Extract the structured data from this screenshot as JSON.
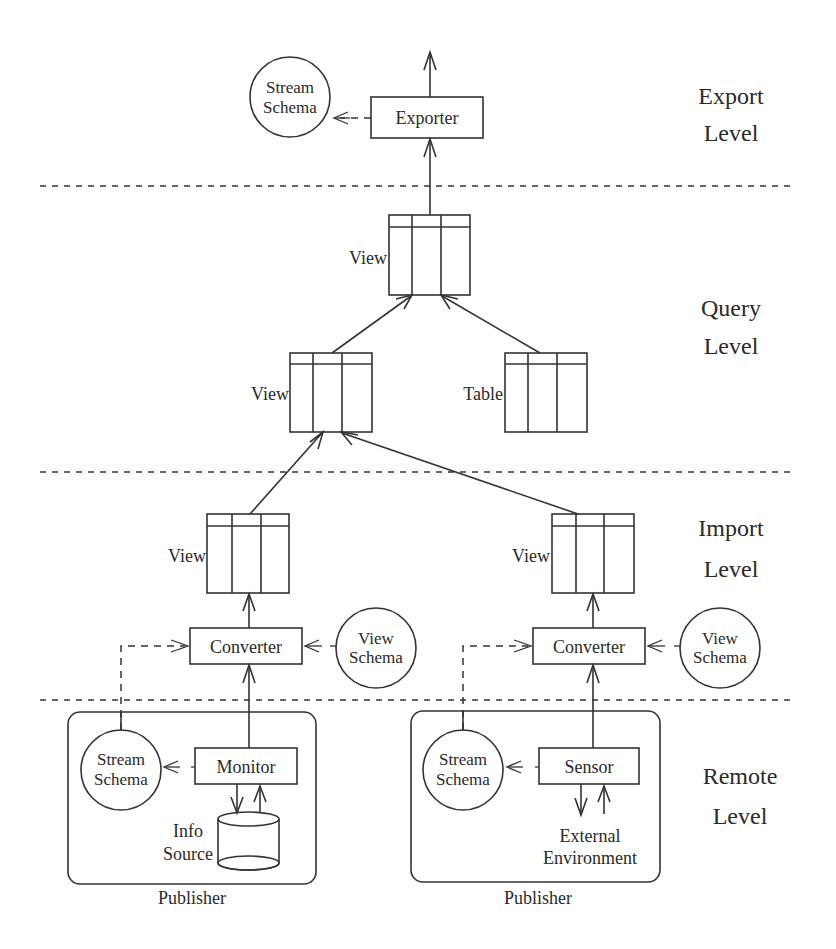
{
  "diagram": {
    "type": "layered architecture diagram",
    "levels": [
      {
        "id": "export",
        "line1": "Export",
        "line2": "Level"
      },
      {
        "id": "query",
        "line1": "Query",
        "line2": "Level"
      },
      {
        "id": "import",
        "line1": "Import",
        "line2": "Level"
      },
      {
        "id": "remote",
        "line1": "Remote",
        "line2": "Level"
      }
    ],
    "export": {
      "exporter": "Exporter",
      "stream_schema": {
        "line1": "Stream",
        "line2": "Schema"
      }
    },
    "query": {
      "top_view": "View",
      "mid_view": "View",
      "table": "Table"
    },
    "import": {
      "left_view": "View",
      "right_view": "View",
      "left_converter": "Converter",
      "right_converter": "Converter",
      "left_view_schema": {
        "line1": "View",
        "line2": "Schema"
      },
      "right_view_schema": {
        "line1": "View",
        "line2": "Schema"
      }
    },
    "remote": {
      "left_publisher": {
        "label": "Publisher",
        "stream_schema": {
          "line1": "Stream",
          "line2": "Schema"
        },
        "component": "Monitor",
        "source": {
          "line1": "Info",
          "line2": "Source"
        }
      },
      "right_publisher": {
        "label": "Publisher",
        "stream_schema": {
          "line1": "Stream",
          "line2": "Schema"
        },
        "component": "Sensor",
        "source": {
          "line1": "External",
          "line2": "Environment"
        }
      }
    },
    "edges": [
      {
        "from": "Exporter",
        "to": "output",
        "style": "solid"
      },
      {
        "from": "Exporter",
        "to": "Stream Schema (export)",
        "style": "dashed"
      },
      {
        "from": "View (query top)",
        "to": "Exporter",
        "style": "solid"
      },
      {
        "from": "View (query mid)",
        "to": "View (query top)",
        "style": "solid"
      },
      {
        "from": "Table",
        "to": "View (query top)",
        "style": "solid"
      },
      {
        "from": "View (import left)",
        "to": "View (query mid)",
        "style": "solid"
      },
      {
        "from": "View (import right)",
        "to": "View (query mid)",
        "style": "solid"
      },
      {
        "from": "Converter (left)",
        "to": "View (import left)",
        "style": "solid"
      },
      {
        "from": "Converter (right)",
        "to": "View (import right)",
        "style": "solid"
      },
      {
        "from": "View Schema (left)",
        "to": "Converter (left)",
        "style": "dashed"
      },
      {
        "from": "View Schema (right)",
        "to": "Converter (right)",
        "style": "dashed"
      },
      {
        "from": "Stream Schema (left publisher)",
        "to": "Converter (left)",
        "style": "dashed"
      },
      {
        "from": "Stream Schema (right publisher)",
        "to": "Converter (right)",
        "style": "dashed"
      },
      {
        "from": "Monitor",
        "to": "Converter (left)",
        "style": "solid"
      },
      {
        "from": "Sensor",
        "to": "Converter (right)",
        "style": "solid"
      },
      {
        "from": "Monitor",
        "to": "Stream Schema (left publisher)",
        "style": "dashed"
      },
      {
        "from": "Sensor",
        "to": "Stream Schema (right publisher)",
        "style": "dashed"
      },
      {
        "from": "Monitor",
        "to": "Info Source",
        "style": "bidirectional"
      },
      {
        "from": "Sensor",
        "to": "External Environment",
        "style": "bidirectional"
      }
    ]
  }
}
